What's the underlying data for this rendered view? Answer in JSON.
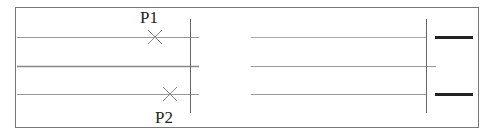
{
  "diagram": {
    "frame": {
      "x": 15,
      "y": 7,
      "width": 463,
      "height": 120,
      "stroke": "#777777"
    },
    "left_panel": {
      "horizontal_lines": [
        {
          "x1": 17,
          "x2": 199,
          "y": 37,
          "stroke": "#999999",
          "width": 1
        },
        {
          "x1": 17,
          "x2": 199,
          "y": 66,
          "stroke": "#888888",
          "width": 1.3
        },
        {
          "x1": 17,
          "x2": 199,
          "y": 94,
          "stroke": "#999999",
          "width": 1
        }
      ],
      "vertical_line": {
        "x": 190,
        "y1": 19,
        "y2": 113,
        "stroke": "#666666"
      },
      "points": [
        {
          "label": "P1",
          "marker": "cross",
          "x": 155,
          "y": 37,
          "label_x": 140,
          "label_y": 23
        },
        {
          "label": "P2",
          "marker": "cross",
          "x": 170,
          "y": 94,
          "label_x": 155,
          "label_y": 123
        }
      ]
    },
    "right_panel": {
      "horizontal_lines": [
        {
          "x1": 251,
          "x2": 426,
          "y": 37,
          "stroke": "#aaaaaa",
          "width": 1
        },
        {
          "x1": 251,
          "x2": 436,
          "y": 66,
          "stroke": "#999999",
          "width": 1
        },
        {
          "x1": 251,
          "x2": 426,
          "y": 94,
          "stroke": "#999999",
          "width": 1
        }
      ],
      "vertical_line": {
        "x": 426,
        "y1": 19,
        "y2": 113,
        "stroke": "#666666"
      },
      "thick_segments": [
        {
          "x1": 435,
          "x2": 473,
          "y": 37,
          "stroke": "#222222",
          "width": 3
        },
        {
          "x1": 435,
          "x2": 473,
          "y": 94,
          "stroke": "#222222",
          "width": 3
        }
      ]
    }
  }
}
